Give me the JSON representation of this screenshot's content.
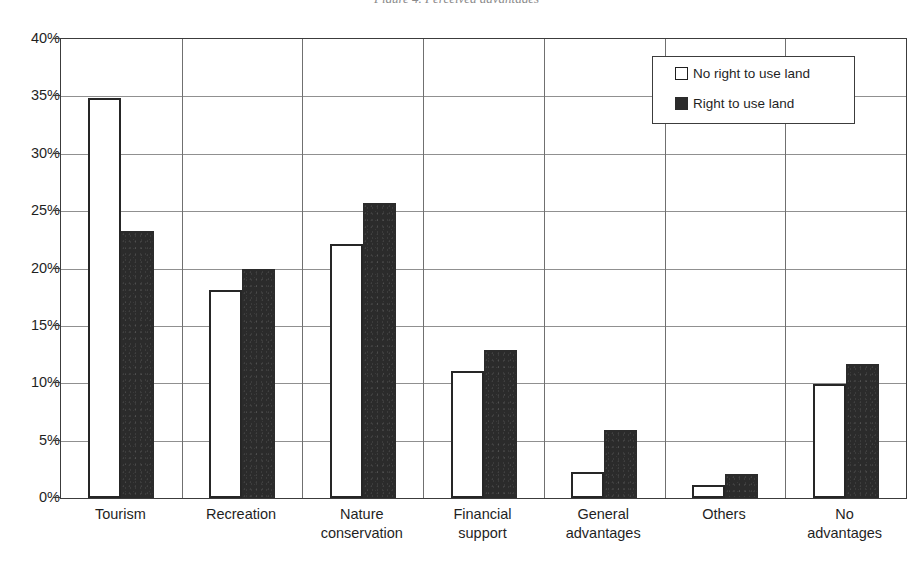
{
  "caption_fragment": "Figure 4. Perceived advantages",
  "legend": {
    "position": "top-right",
    "items": [
      {
        "label": "No right to use land",
        "swatch": "open-square-icon",
        "color": "#ffffff"
      },
      {
        "label": "Right to use land",
        "swatch": "filled-square-icon",
        "color": "#2b2b2b"
      }
    ]
  },
  "axes": {
    "y_ticks": [
      "0%",
      "5%",
      "10%",
      "15%",
      "20%",
      "25%",
      "30%",
      "35%",
      "40%"
    ],
    "y_min": 0,
    "y_max": 40,
    "y_step": 5,
    "ylabel": "",
    "xlabel": "",
    "grid": true
  },
  "chart_data": {
    "type": "bar",
    "title": "",
    "subtitle": "",
    "xlabel": "",
    "ylabel": "",
    "ylim": [
      0,
      40
    ],
    "ytick_values": [
      0,
      5,
      10,
      15,
      20,
      25,
      30,
      35,
      40
    ],
    "ytick_labels": [
      "0%",
      "5%",
      "10%",
      "15%",
      "20%",
      "25%",
      "30%",
      "35%",
      "40%"
    ],
    "grid": true,
    "legend_position": "top-right",
    "units": "percent",
    "categories": [
      "Tourism",
      "Recreation",
      "Nature conservation",
      "Financial support",
      "General advantages",
      "Others",
      "No advantages"
    ],
    "category_lines": [
      [
        "Tourism"
      ],
      [
        "Recreation"
      ],
      [
        "Nature",
        "conservation"
      ],
      [
        "Financial",
        "support"
      ],
      [
        "General",
        "advantages"
      ],
      [
        "Others"
      ],
      [
        "No",
        "advantages"
      ]
    ],
    "series": [
      {
        "name": "No right to use land",
        "color": "#ffffff",
        "edge_color": "#262626",
        "values": [
          34.9,
          18.1,
          22.1,
          11.1,
          2.3,
          1.1,
          9.9
        ]
      },
      {
        "name": "Right to use land",
        "color": "#2b2b2b",
        "edge_color": "#2b2b2b",
        "values": [
          23.3,
          20.0,
          25.7,
          12.9,
          5.9,
          2.1,
          11.7
        ]
      }
    ]
  }
}
